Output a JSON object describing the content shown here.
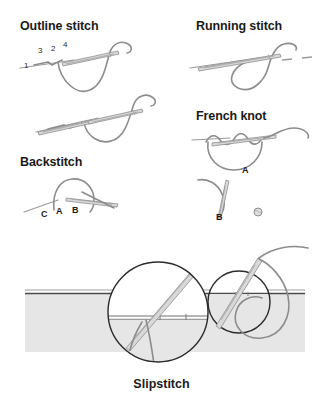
{
  "document": {
    "type": "embroidery-stitch-instruction-diagram",
    "background_color": "#ffffff",
    "ink_color": "#1a1a1a",
    "thread_color": "#8c8c8c",
    "fabric_color": "#e6e6e6"
  },
  "sections": {
    "outline_stitch": {
      "heading": "Outline stitch",
      "step_labels": [
        "1",
        "3",
        "2",
        "4"
      ],
      "icons": [
        "needle-icon",
        "thread-curve-icon"
      ]
    },
    "running_stitch": {
      "heading": "Running stitch",
      "icons": [
        "needle-icon",
        "thread-loop-icon",
        "dashed-stitch-icon"
      ]
    },
    "french_knot": {
      "heading": "French knot",
      "step_labels": [
        "A",
        "B"
      ],
      "icons": [
        "needle-icon",
        "wrapped-thread-icon",
        "knot-dot-icon"
      ]
    },
    "backstitch": {
      "heading": "Backstitch",
      "step_labels": [
        "C",
        "A",
        "B"
      ],
      "icons": [
        "needle-icon",
        "thread-arc-icon"
      ]
    },
    "slipstitch": {
      "caption": "Slipstitch",
      "icons": [
        "fabric-band-icon",
        "fold-line-icon",
        "magnifier-circle-icon",
        "needle-icon",
        "thread-loop-icon"
      ]
    }
  }
}
